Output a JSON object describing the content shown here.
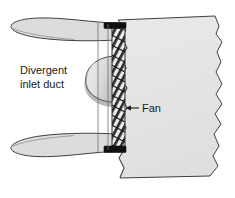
{
  "figure": {
    "background_color": "#ffffff",
    "width": 235,
    "height": 198
  },
  "labels": {
    "inlet_duct_line1": "Divergent",
    "inlet_duct_line2": "inlet duct",
    "fan": "Fan"
  },
  "colors": {
    "outline": "#3a3a3a",
    "body_fill": "#e4e4e4",
    "duct_fill": "#dcdcdc",
    "spinner_fill": "#d8d8d8",
    "spinner_shadow": "#b4b4b4",
    "blade_dark": "#2a2a2a",
    "blade_light": "#f0f0f0",
    "endcap": "#111111",
    "guide_line": "#6e6e6e",
    "text": "#1a1a1a"
  },
  "parts": {
    "engine_body": "engine-body-torn-section",
    "upper_duct_lip": "upper-divergent-duct-lip",
    "lower_duct_lip": "lower-divergent-duct-lip",
    "spinner": "fan-spinner-hub",
    "fan_blades": "fan-blade-row",
    "top_endcap": "fan-top-end-cap",
    "bottom_endcap": "fan-bottom-end-cap",
    "guide_line_left": "duct-throat-guide-line-left",
    "guide_line_right": "duct-throat-guide-line-right",
    "fan_leader": "fan-label-leader-arrow"
  }
}
